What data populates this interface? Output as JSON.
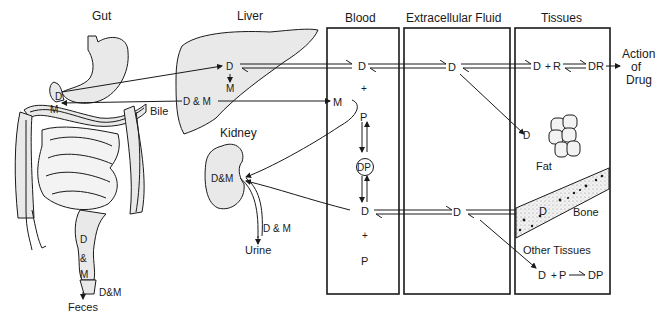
{
  "diagram": {
    "type": "drug distribution schematic",
    "headings": {
      "gut": "Gut",
      "liver": "Liver",
      "blood": "Blood",
      "ecf": "Extracellular Fluid",
      "tissues": "Tissues",
      "kidney": "Kidney"
    },
    "gut": {
      "d": "D",
      "m": "M",
      "bile": "Bile",
      "lower_d": "D",
      "lower_amp": "&",
      "lower_m": "M",
      "dm": "D&M",
      "feces": "Feces"
    },
    "liver": {
      "d": "D",
      "m": "M",
      "dm": "D & M"
    },
    "kidney": {
      "dm": "D&M",
      "urine_dm": "D & M",
      "urine": "Urine"
    },
    "blood": {
      "d_top": "D",
      "plus_top": "+",
      "m": "M",
      "p_top": "P",
      "dp": "DP",
      "d_bottom": "D",
      "plus_bottom": "+",
      "p_bottom": "P"
    },
    "ecf": {
      "d_top": "D",
      "d_bottom": "D"
    },
    "tissues": {
      "d_top": "D",
      "plus": "+",
      "r": "R",
      "dr": "DR",
      "action": [
        "Action",
        "of",
        "Drug"
      ],
      "fat_d": "D",
      "fat": "Fat",
      "bone_d": "D",
      "bone": "Bone",
      "other": "Other Tissues",
      "other_d": "D",
      "other_plus": "+",
      "other_p": "P",
      "other_dp": "DP"
    },
    "colors": {
      "ink": "#1a1a1a",
      "organ_fill": "#e9e9e9",
      "background": "#ffffff"
    }
  }
}
